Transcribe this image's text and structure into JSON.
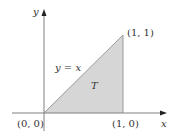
{
  "diagram": {
    "axes": {
      "x_label": "x",
      "y_label": "y"
    },
    "points": {
      "origin": "(0, 0)",
      "bottom_right": "(1, 0)",
      "top_right": "(1, 1)"
    },
    "line_label": "y = x",
    "region_label": "T",
    "colors": {
      "region_fill": "#d6d6d6",
      "edge": "#9a9a9a",
      "axis": "#808080",
      "text": "#333333"
    }
  }
}
